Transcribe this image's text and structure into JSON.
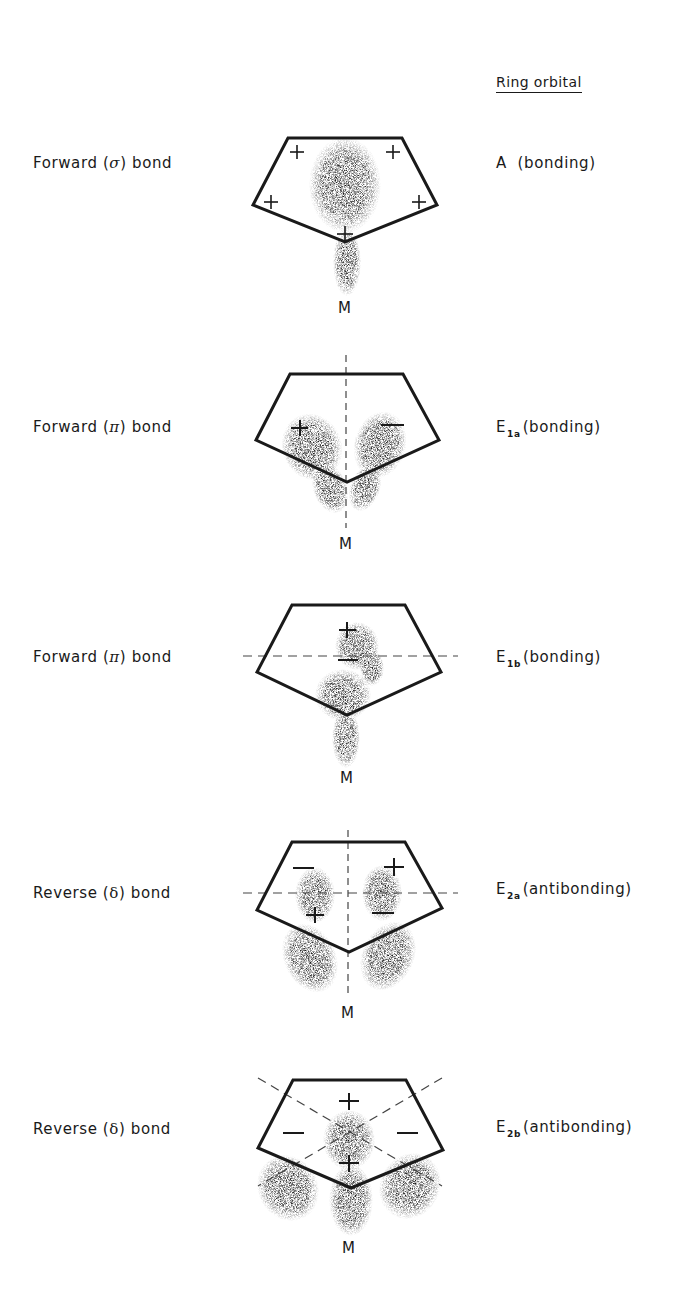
{
  "header": {
    "title": "Ring orbital"
  },
  "rows": [
    {
      "bond_prefix": "Forward (",
      "bond_symbol": "σ",
      "bond_suffix": ") bond",
      "orbital_main": "A",
      "orbital_sub": "",
      "orbital_desc": "  (bonding)",
      "metal_label": "M",
      "signs": [
        "+",
        "+",
        "+",
        "+",
        "+"
      ],
      "nodal_planes": "none"
    },
    {
      "bond_prefix": "Forward (",
      "bond_symbol": "π",
      "bond_suffix": ") bond",
      "orbital_main": "E",
      "orbital_sub": "1a",
      "orbital_desc": "(bonding)",
      "metal_label": "M",
      "signs": [
        "+",
        "−"
      ],
      "nodal_planes": "vertical"
    },
    {
      "bond_prefix": "Forward (",
      "bond_symbol": "π",
      "bond_suffix": ") bond",
      "orbital_main": "E",
      "orbital_sub": "1b",
      "orbital_desc": "(bonding)",
      "metal_label": "M",
      "signs": [
        "+",
        "−"
      ],
      "nodal_planes": "horizontal"
    },
    {
      "bond_prefix": "Reverse (",
      "bond_symbol": "δ",
      "bond_suffix": ") bond",
      "orbital_main": "E",
      "orbital_sub": "2a",
      "orbital_desc": "(antibonding)",
      "metal_label": "M",
      "signs": [
        "−",
        "+",
        "+",
        "−"
      ],
      "nodal_planes": "vertical+horizontal"
    },
    {
      "bond_prefix": "Reverse (",
      "bond_symbol": "δ",
      "bond_suffix": ") bond",
      "orbital_main": "E",
      "orbital_sub": "2b",
      "orbital_desc": "(antibonding)",
      "metal_label": "M",
      "signs": [
        "+",
        "−",
        "−",
        "+"
      ],
      "nodal_planes": "diagonal"
    }
  ],
  "colors": {
    "ink": "#1a1a1a",
    "dashed": "#555555",
    "density": "#222222"
  }
}
